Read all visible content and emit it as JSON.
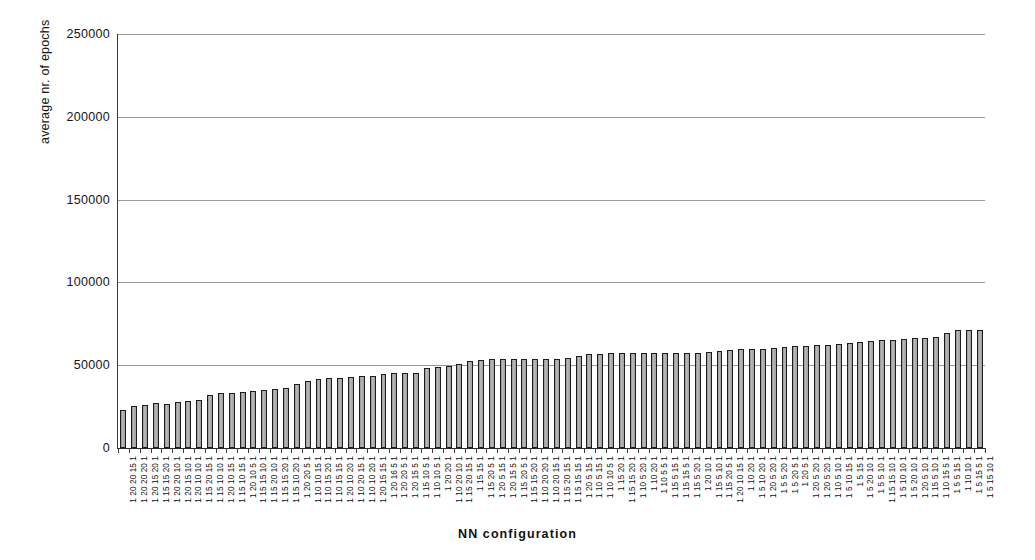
{
  "chart_data": {
    "type": "bar",
    "title": "",
    "xlabel": "NN configuration",
    "ylabel": "average nr. of epochs",
    "ylim": [
      0,
      250000
    ],
    "ytick_step": 50000,
    "ytick_labels": [
      "250000",
      "200000",
      "150000",
      "100000",
      "50000",
      "0"
    ],
    "ytick_values": [
      250000,
      200000,
      150000,
      100000,
      50000,
      0
    ],
    "grid": true,
    "legend": false,
    "bar_color": "#a9a9a9",
    "bar_border_color": "#1c1c1c",
    "categories": [
      "1 20 20 15 1",
      "1 20 20 20 1",
      "1 20 15 20 1",
      "1 15 15 20 1",
      "1 20 20 10 1",
      "1 20 15 10 1",
      "1 20 10 10 1",
      "1 15 20 15 1",
      "1 15 10 10 1",
      "1 20 10 15 1",
      "1 15 10 15 1",
      "1 20 10 5 1",
      "1 15 15 10 1",
      "1 15 20 10 1",
      "1 15 15 20 1",
      "1 15 10 20 1",
      "1 20 20 5 1",
      "1 10 10 15 1",
      "1 10 15 20 1",
      "1 10 15 15 1",
      "1 20 10 20 1",
      "1 10 20 15 1",
      "1 10 10 20 1",
      "1 20 15 15 1",
      "1 20 16 5 1",
      "1 20 20 5 1",
      "1 20 15 5 1",
      "1 15 10 5 1",
      "1 10 10 5 1",
      "1 20 20 1",
      "1 10 20 10 1",
      "1 15 20 15 1",
      "1 15 15 1",
      "1 15 20 5 1",
      "1 20 5 15 1",
      "1 20 15 5 1",
      "1 15 20 5 1",
      "1 15 15 20 1",
      "1 10 20 20 1",
      "1 10 20 15 1",
      "1 15 20 15 1",
      "1 15 15 15 1",
      "1 20 5 15 1",
      "1 10 5 15 1",
      "1 10 10 5 1",
      "1 15 20 1",
      "1 15 15 20 1",
      "1 10 5 20 1",
      "1 10 20 1",
      "1 10 5 5 1",
      "1 15 5 15 1",
      "1 15 15 5 1",
      "1 15 5 20 1",
      "1 20 10 1",
      "1 15 5 10 1",
      "1 15 20 5 1",
      "1 20 10 15 1",
      "1 10 20 1",
      "1 5 10 20 1",
      "1 20 5 20 1",
      "1 5 5 20 1",
      "1 5 20 5 1",
      "1 20 5 1",
      "1 20 5 20 1",
      "1 20 5 20 1",
      "1 10 5 10 1",
      "1 5 10 15 1",
      "1 5 15 1",
      "1 5 20 10 1",
      "1 5 5 10 1",
      "1 15 15 10 1",
      "1 5 10 10 1",
      "1 5 20 10 1",
      "1 20 5 10 1",
      "1 15 5 10 1",
      "1 10 15 5 1",
      "1 5 5 15 1",
      "1 10 10 1",
      "1 5 15 5 1",
      "1 5 15 10 1"
    ],
    "values": [
      23000,
      25500,
      26000,
      27000,
      26500,
      28000,
      28500,
      29000,
      32000,
      33000,
      33500,
      34000,
      34500,
      35000,
      35500,
      36500,
      38500,
      40500,
      41500,
      42500,
      42500,
      43000,
      43500,
      43500,
      44500,
      45000,
      45000,
      45500,
      48500,
      49000,
      49500,
      50500,
      52500,
      53000,
      53500,
      53500,
      53500,
      53500,
      53500,
      53500,
      54000,
      54500,
      55500,
      56500,
      57000,
      57500,
      57500,
      57500,
      57500,
      57500,
      57500,
      57500,
      57500,
      57500,
      58000,
      58500,
      59000,
      59500,
      60000,
      60000,
      60500,
      61000,
      61500,
      61500,
      62000,
      62500,
      63000,
      63500,
      64000,
      64500,
      65000,
      65500,
      66000,
      66500,
      66500,
      67000,
      69500,
      71000,
      71500,
      71500
    ]
  },
  "axis": {
    "x_title": "NN configuration",
    "y_title": "average nr. of epochs"
  }
}
